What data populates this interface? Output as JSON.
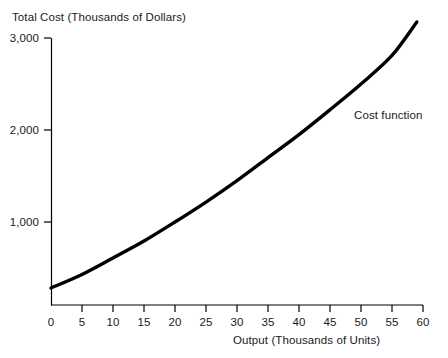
{
  "chart_data": {
    "type": "line",
    "title": "",
    "ylabel": "Total Cost (Thousands of Dollars)",
    "xlabel": "Output (Thousands of Units)",
    "xlim": [
      0,
      60
    ],
    "ylim": [
      0,
      3200
    ],
    "grid": false,
    "legend_position": "inline-annotation",
    "xticks": [
      0,
      5,
      10,
      15,
      20,
      25,
      30,
      35,
      40,
      45,
      50,
      55,
      60
    ],
    "xtick_labels": [
      "0",
      "5",
      "10",
      "15",
      "20",
      "25",
      "30",
      "35",
      "40",
      "45",
      "50",
      "55",
      "60"
    ],
    "yticks": [
      1000,
      2000,
      3000
    ],
    "ytick_labels": [
      "1,000",
      "2,000",
      "3,000"
    ],
    "series": [
      {
        "name": "Cost function",
        "annotation": "Cost function",
        "color": "#000000",
        "x": [
          0,
          5,
          10,
          15,
          20,
          25,
          30,
          35,
          40,
          45,
          50,
          55,
          59
        ],
        "values": [
          283,
          430,
          609,
          793,
          1000,
          1217,
          1450,
          1700,
          1950,
          2220,
          2500,
          2810,
          3174
        ]
      }
    ]
  },
  "axes": {
    "y_title": "Total Cost (Thousands of Dollars)",
    "x_title": "Output (Thousands of Units)"
  },
  "annotations": {
    "cost_function": "Cost function"
  }
}
